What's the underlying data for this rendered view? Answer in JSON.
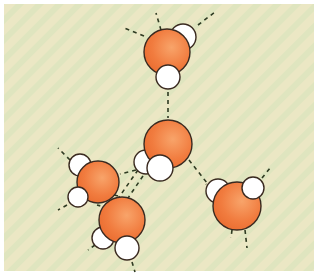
{
  "figure": {
    "title": "",
    "colors": {
      "background_a": "#ece8c2",
      "background_b": "#dfe6bd",
      "border": "#ffffff",
      "oxygen": "#f07a3c",
      "oxygen_highlight": "#f79a5a",
      "hydrogen": "#ffffff",
      "outline": "#3a2a20",
      "hbond": "#2f3b22"
    },
    "molecules": [
      {
        "name": "top",
        "O": [
          167,
          52,
          23
        ],
        "H": [
          [
            183,
            37,
            13
          ],
          [
            168,
            77,
            12
          ]
        ]
      },
      {
        "name": "center",
        "O": [
          168,
          144,
          24
        ],
        "H": [
          [
            146,
            162,
            12
          ],
          [
            160,
            168,
            13
          ]
        ]
      },
      {
        "name": "left",
        "O": [
          98,
          182,
          21
        ],
        "H": [
          [
            80,
            165,
            11
          ],
          [
            78,
            197,
            10
          ]
        ]
      },
      {
        "name": "bottom",
        "O": [
          122,
          220,
          23
        ],
        "H": [
          [
            103,
            238,
            11
          ],
          [
            127,
            248,
            12
          ]
        ]
      },
      {
        "name": "right",
        "O": [
          237,
          206,
          24
        ],
        "H": [
          [
            218,
            191,
            12
          ],
          [
            253,
            188,
            11
          ]
        ]
      }
    ],
    "hbonds": [
      [
        [
          144,
          36
        ],
        [
          122,
          27
        ]
      ],
      [
        [
          161,
          30
        ],
        [
          156,
          13
        ]
      ],
      [
        [
          198,
          25
        ],
        [
          215,
          12
        ]
      ],
      [
        [
          168,
          92
        ],
        [
          168,
          118
        ]
      ],
      [
        [
          189,
          160
        ],
        [
          211,
          188
        ]
      ],
      [
        [
          138,
          170
        ],
        [
          117,
          200
        ]
      ],
      [
        [
          143,
          176
        ],
        [
          128,
          198
        ]
      ],
      [
        [
          136,
          170
        ],
        [
          120,
          174
        ]
      ],
      [
        [
          70,
          160
        ],
        [
          58,
          148
        ]
      ],
      [
        [
          67,
          205
        ],
        [
          58,
          210
        ]
      ],
      [
        [
          118,
          196
        ],
        [
          104,
          192
        ]
      ],
      [
        [
          108,
          208
        ],
        [
          97,
          205
        ]
      ],
      [
        [
          95,
          245
        ],
        [
          88,
          250
        ]
      ],
      [
        [
          132,
          262
        ],
        [
          135,
          272
        ]
      ],
      [
        [
          262,
          178
        ],
        [
          270,
          168
        ]
      ],
      [
        [
          245,
          230
        ],
        [
          247,
          248
        ]
      ],
      [
        [
          232,
          230
        ],
        [
          231,
          238
        ]
      ],
      [
        [
          212,
          190
        ],
        [
          206,
          184
        ]
      ],
      [
        [
          175,
          66
        ],
        [
          176,
          58
        ]
      ]
    ]
  }
}
